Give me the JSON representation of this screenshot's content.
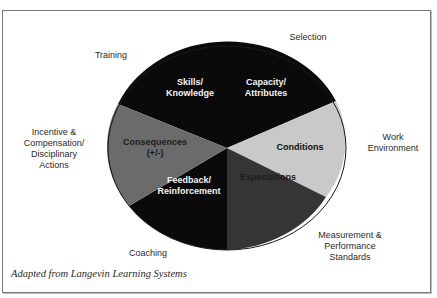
{
  "diagram": {
    "type": "pie-wheel",
    "center": {
      "x": 227,
      "y": 148
    },
    "radius": {
      "rx": 119,
      "ry": 102
    },
    "slices": [
      {
        "label_lines": [
          "Skills/",
          "Knowledge"
        ],
        "color": "#0a0a0a",
        "text_tone": "light"
      },
      {
        "label_lines": [
          "Capacity/",
          "Attributes"
        ],
        "color": "#0a0a0a",
        "text_tone": "light"
      },
      {
        "label_lines": [
          "Conditions"
        ],
        "color": "#c9c9c9",
        "text_tone": "dark"
      },
      {
        "label_lines": [
          "Expectations"
        ],
        "color": "#353535",
        "text_tone": "muted"
      },
      {
        "label_lines": [
          "Feedback/",
          "Reinforcement"
        ],
        "color": "#0a0a0a",
        "text_tone": "light"
      },
      {
        "label_lines": [
          "Consequences",
          "(+/-)"
        ],
        "color": "#6b6b6b",
        "text_tone": "muted"
      }
    ],
    "outer_labels": [
      {
        "name": "training",
        "lines": [
          "Training"
        ]
      },
      {
        "name": "selection",
        "lines": [
          "Selection"
        ]
      },
      {
        "name": "work-environment",
        "lines": [
          "Work",
          "Environment"
        ]
      },
      {
        "name": "measurement",
        "lines": [
          "Measurement &",
          "Performance",
          "Standards"
        ]
      },
      {
        "name": "coaching",
        "lines": [
          "Coaching"
        ]
      },
      {
        "name": "incentive",
        "lines": [
          "Incentive &",
          "Compensation/",
          "Disciplinary",
          "Actions"
        ]
      }
    ],
    "caption": "Adapted from Langevin Learning Systems",
    "colors": {
      "border": "#7a7a7a",
      "outline": "#1a1a1a",
      "background": "#ffffff"
    }
  }
}
